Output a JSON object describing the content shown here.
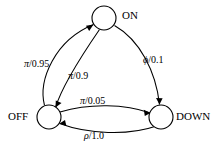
{
  "diagram": {
    "type": "state-transition-diagram",
    "title": "",
    "nodes": [
      {
        "id": "on",
        "label": "ON",
        "cx": 104,
        "cy": 18,
        "r": 12
      },
      {
        "id": "off",
        "label": "OFF",
        "cx": 49,
        "cy": 117,
        "r": 12
      },
      {
        "id": "down",
        "label": "DOWN",
        "cx": 161,
        "cy": 117,
        "r": 12
      }
    ],
    "edges": [
      {
        "id": "e1",
        "from": "off",
        "to": "on",
        "symbol": "π",
        "probability": "0.95",
        "label": "π/0.95"
      },
      {
        "id": "e2",
        "from": "on",
        "to": "off",
        "symbol": "π",
        "probability": "0.9",
        "label": "π/0.9"
      },
      {
        "id": "e3",
        "from": "on",
        "to": "down",
        "symbol": "ϕ",
        "probability": "0.1",
        "label": "ϕ/0.1"
      },
      {
        "id": "e4",
        "from": "off",
        "to": "down",
        "symbol": "π",
        "probability": "0.05",
        "label": "π/0.05"
      },
      {
        "id": "e5",
        "from": "down",
        "to": "off",
        "symbol": "ρ",
        "probability": "1.0",
        "label": "ρ/1.0"
      }
    ],
    "colors": {
      "stroke": "#000000",
      "fill": "#ffffff",
      "background": "#ffffff"
    }
  }
}
